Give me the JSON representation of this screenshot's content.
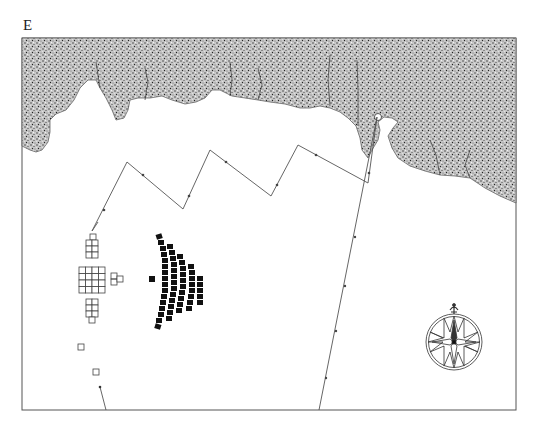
{
  "panel": {
    "label": "E"
  },
  "colors": {
    "frame": "#555555",
    "land_fill": "#bdbdbd",
    "land_speckle": "#333333",
    "track": "#555555",
    "fleet_a_fill": "#ffffff",
    "fleet_a_stroke": "#444444",
    "fleet_b_fill": "#111111"
  },
  "legend_items": {
    "coastline": "land mass (stippled)",
    "fleet_a": "formation of open squares (left)",
    "fleet_b": "crescent formation of filled squares",
    "compass": "compass rose"
  },
  "formations": {
    "fleet_a": {
      "top_column": {
        "rows": 3,
        "cols": 2,
        "lead": 1
      },
      "center_block": {
        "rows": 4,
        "cols": 4
      },
      "bottom_column": {
        "rows": 3,
        "cols": 2,
        "trail": 1
      },
      "side_pair": 2,
      "stragglers": 2
    },
    "fleet_b": {
      "arcs": [
        14,
        12,
        10,
        8,
        5
      ],
      "lead_ship": 1
    }
  }
}
